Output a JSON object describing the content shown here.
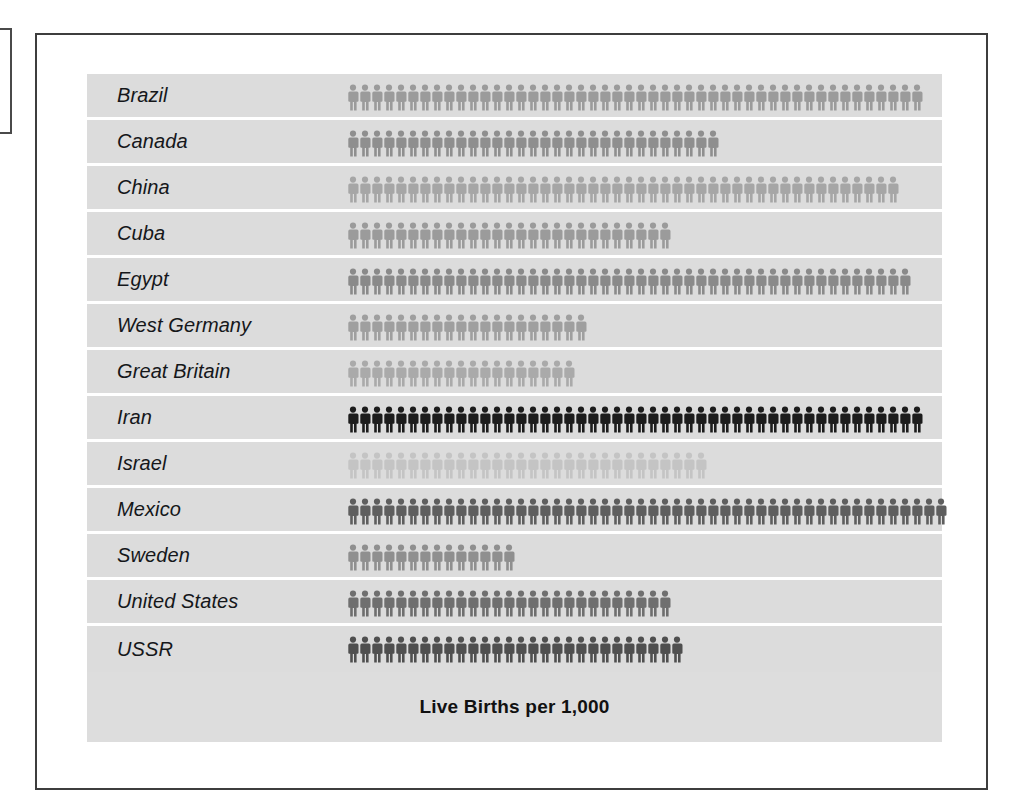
{
  "chart_data": {
    "type": "bar",
    "chart_style": "pictogram",
    "title": "Live Births per 1,000",
    "xlabel": "",
    "ylabel": "",
    "unit_label": "person-icon",
    "categories": [
      "Brazil",
      "Canada",
      "China",
      "Cuba",
      "Egypt",
      "West Germany",
      "Great Britain",
      "Iran",
      "Israel",
      "Mexico",
      "Sweden",
      "United States",
      "USSR"
    ],
    "values": [
      48,
      31,
      46,
      27,
      47,
      20,
      19,
      48,
      30,
      50,
      14,
      27,
      28
    ],
    "icon_colors": [
      "#9b9b9b",
      "#8f8f8f",
      "#a6a6a6",
      "#9b9b9b",
      "#8a8a8a",
      "#9f9f9f",
      "#aaaaaa",
      "#1c1c1c",
      "#c4c4c4",
      "#5e5e5e",
      "#8f8f8f",
      "#6f6f6f",
      "#4f4f4f"
    ],
    "rows": [
      {
        "label": "Brazil",
        "count": 48,
        "color": "#9b9b9b"
      },
      {
        "label": "Canada",
        "count": 31,
        "color": "#8f8f8f"
      },
      {
        "label": "China",
        "count": 46,
        "color": "#a6a6a6"
      },
      {
        "label": "Cuba",
        "count": 27,
        "color": "#9b9b9b"
      },
      {
        "label": "Egypt",
        "count": 47,
        "color": "#8a8a8a"
      },
      {
        "label": "West Germany",
        "count": 20,
        "color": "#9f9f9f"
      },
      {
        "label": "Great Britain",
        "count": 19,
        "color": "#aaaaaa"
      },
      {
        "label": "Iran",
        "count": 48,
        "color": "#1c1c1c"
      },
      {
        "label": "Israel",
        "count": 30,
        "color": "#c4c4c4"
      },
      {
        "label": "Mexico",
        "count": 50,
        "color": "#5e5e5e"
      },
      {
        "label": "Sweden",
        "count": 14,
        "color": "#8f8f8f"
      },
      {
        "label": "United States",
        "count": 27,
        "color": "#6f6f6f"
      },
      {
        "label": "USSR",
        "count": 28,
        "color": "#4f4f4f"
      }
    ],
    "grid": false,
    "legend": "none"
  },
  "colors": {
    "panel_background": "#dcdcdc",
    "row_separator": "#ffffff",
    "frame_border": "#3d3d3d",
    "page_background": "#ffffff",
    "label_text": "#15171a",
    "title_text": "#111111"
  }
}
